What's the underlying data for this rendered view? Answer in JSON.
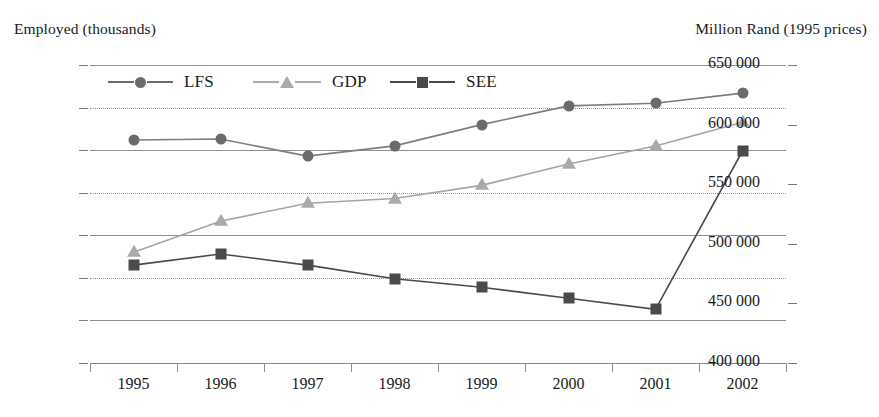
{
  "chart_data": {
    "type": "line",
    "title": "",
    "left_axis_title": "Employed (thousands)",
    "right_axis_title": "Million Rand (1995 prices)",
    "xlabel": "",
    "categories": [
      "1995",
      "1996",
      "1997",
      "1998",
      "1999",
      "2000",
      "2001",
      "2002"
    ],
    "left_ticks": [
      "7.5",
      "7.0",
      "6.5",
      "6.0",
      "5.5",
      "5.0",
      "4.5",
      "4.0"
    ],
    "left_tick_values": [
      7.5,
      7.0,
      6.5,
      6.0,
      5.5,
      5.0,
      4.5,
      4.0
    ],
    "right_ticks": [
      "650 000",
      "600 000",
      "550 000",
      "500 000",
      "450 000",
      "400 000"
    ],
    "right_tick_values": [
      650000,
      600000,
      550000,
      500000,
      450000,
      400000
    ],
    "ylim_left": [
      4.0,
      7.5
    ],
    "ylim_right": [
      400000,
      650000
    ],
    "grid": true,
    "legend_position": "top-left-inside",
    "series": [
      {
        "name": "LFS",
        "axis": "left",
        "marker": "circle",
        "color": "#6b6b6b",
        "line_color": "#7d7d7d",
        "values": [
          6.62,
          6.63,
          6.43,
          6.55,
          6.8,
          7.02,
          7.05,
          7.17
        ]
      },
      {
        "name": "GDP",
        "axis": "right",
        "marker": "triangle",
        "color": "#aaaaaa",
        "line_color": "#a5a5a5",
        "values": [
          493000,
          519000,
          534000,
          538000,
          549000,
          567000,
          582000,
          602000
        ],
        "left_equivalent": [
          5.38,
          5.73,
          5.93,
          5.97,
          6.13,
          6.41,
          6.62,
          6.9
        ]
      },
      {
        "name": "SEE",
        "axis": "left",
        "marker": "square",
        "color": "#4a4a4a",
        "line_color": "#4a4a4a",
        "values": [
          5.15,
          5.28,
          5.15,
          4.99,
          4.89,
          4.76,
          4.63,
          6.49
        ]
      }
    ]
  },
  "legend": {
    "items": [
      {
        "label": "LFS",
        "marker": "circle",
        "color": "#6b6b6b"
      },
      {
        "label": "GDP",
        "marker": "triangle",
        "color": "#aaaaaa"
      },
      {
        "label": "SEE",
        "marker": "square",
        "color": "#4a4a4a"
      }
    ]
  },
  "colors": {
    "lfs": "#6b6b6b",
    "gdp": "#aaaaaa",
    "see": "#4a4a4a",
    "grid": "#9a9a9a",
    "axis": "#8a8a8a",
    "text": "#1a1a1a"
  }
}
